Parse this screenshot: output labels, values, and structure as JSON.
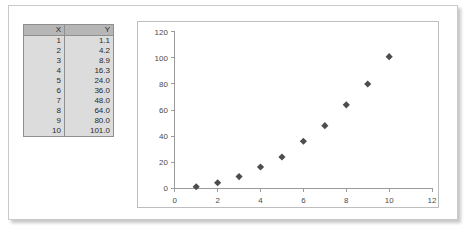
{
  "table": {
    "headers": [
      "X",
      "Y"
    ],
    "rows": [
      {
        "x": "1",
        "y": "1.1"
      },
      {
        "x": "2",
        "y": "4.2"
      },
      {
        "x": "3",
        "y": "8.9"
      },
      {
        "x": "4",
        "y": "16.3"
      },
      {
        "x": "5",
        "y": "24.0"
      },
      {
        "x": "6",
        "y": "36.0"
      },
      {
        "x": "7",
        "y": "48.0"
      },
      {
        "x": "8",
        "y": "64.0"
      },
      {
        "x": "9",
        "y": "80.0"
      },
      {
        "x": "10",
        "y": "101.0"
      }
    ]
  },
  "chart_data": {
    "type": "scatter",
    "title": "",
    "xlabel": "",
    "ylabel": "",
    "xlim": [
      0,
      12
    ],
    "ylim": [
      0,
      120
    ],
    "xticks": [
      0,
      2,
      4,
      6,
      8,
      10,
      12
    ],
    "yticks": [
      0,
      20,
      40,
      60,
      80,
      100,
      120
    ],
    "xtick_labels": [
      "0",
      "2",
      "4",
      "6",
      "8",
      "10",
      "12"
    ],
    "ytick_labels": [
      "0",
      "20",
      "40",
      "60",
      "80",
      "100",
      "120"
    ],
    "grid": false,
    "legend": false,
    "marker": "diamond",
    "marker_color": "#4d4d4d",
    "series": [
      {
        "name": "Y",
        "x": [
          1,
          2,
          3,
          4,
          5,
          6,
          7,
          8,
          9,
          10
        ],
        "values": [
          1.1,
          4.2,
          8.9,
          16.3,
          24.0,
          36.0,
          48.0,
          64.0,
          80.0,
          101.0
        ]
      }
    ]
  },
  "colors": {
    "marker": "#4d4d4d",
    "axis": "#9a9a9a",
    "table_header_bg": "#b6b6b6",
    "table_body_bg": "#dcdcdc",
    "table_border": "#8f8f8f",
    "sheet_border": "#c9c9c9",
    "chart_border": "#bdbdbd"
  }
}
